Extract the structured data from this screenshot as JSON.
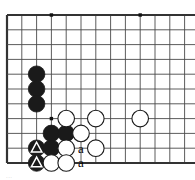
{
  "figure": {
    "kind": "go-board-diagram",
    "caption_fragment": "..."
  },
  "board": {
    "origin_x": 7,
    "origin_y": 15,
    "cell": 14.8,
    "cols": 13,
    "rows": 10,
    "line_color": "#4a4a4a",
    "border_color": "#333333",
    "edge_left": true,
    "edge_top": true,
    "edge_bottom": true,
    "edge_right": false,
    "background": "#ffffff",
    "star_points": [
      {
        "col": 3,
        "row": 0
      },
      {
        "col": 9,
        "row": 0
      },
      {
        "col": 3,
        "row": 7
      }
    ]
  },
  "stones": [
    {
      "color": "black",
      "col": 2,
      "row": 4,
      "mark": "none"
    },
    {
      "color": "black",
      "col": 2,
      "row": 5,
      "mark": "none"
    },
    {
      "color": "black",
      "col": 2,
      "row": 6,
      "mark": "none"
    },
    {
      "color": "black",
      "col": 3,
      "row": 8,
      "mark": "none"
    },
    {
      "color": "black",
      "col": 4,
      "row": 8,
      "mark": "none"
    },
    {
      "color": "black",
      "col": 2,
      "row": 9,
      "mark": "triangle"
    },
    {
      "color": "black",
      "col": 3,
      "row": 9,
      "mark": "none"
    },
    {
      "color": "black",
      "col": 2,
      "row": 10,
      "mark": "triangle"
    },
    {
      "color": "white",
      "col": 4,
      "row": 7,
      "mark": "none"
    },
    {
      "color": "white",
      "col": 6,
      "row": 7,
      "mark": "none"
    },
    {
      "color": "white",
      "col": 9,
      "row": 7,
      "mark": "none"
    },
    {
      "color": "white",
      "col": 5,
      "row": 8,
      "mark": "none"
    },
    {
      "color": "white",
      "col": 4,
      "row": 9,
      "mark": "none"
    },
    {
      "color": "white",
      "col": 6,
      "row": 9,
      "mark": "none"
    },
    {
      "color": "white",
      "col": 3,
      "row": 10,
      "mark": "none"
    },
    {
      "color": "white",
      "col": 4,
      "row": 10,
      "mark": "none"
    }
  ],
  "labels": [
    {
      "text": "a",
      "col": 5,
      "row": 9
    },
    {
      "text": "a",
      "col": 5,
      "row": 10
    }
  ],
  "colors": {
    "black_stone": "#1a1a1a",
    "white_stone": "#ffffff",
    "stone_outline": "#1a1a1a",
    "marker": "#ffffff",
    "label_text": "#000000"
  }
}
